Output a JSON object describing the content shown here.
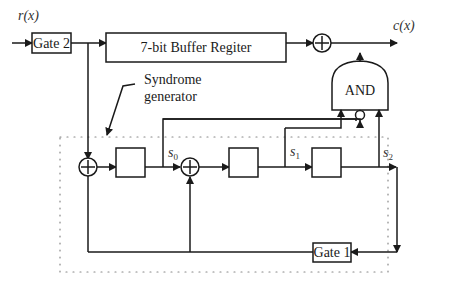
{
  "diagram": {
    "input_label": "r(x)",
    "output_label": "c(x)",
    "gate2_label": "Gate 2",
    "gate1_label": "Gate 1",
    "buffer_label": "7-bit Buffer Regiter",
    "and_label": "AND",
    "syndrome_label_line1": "Syndrome",
    "syndrome_label_line2": "generator",
    "s0_main": "s",
    "s0_sub": "0",
    "s1_main": "s",
    "s1_sub": "1",
    "s2_main": "s",
    "s2_sub": "2",
    "colors": {
      "line": "#1a1a1a",
      "dotted_border": "#888888",
      "background": "#ffffff"
    }
  }
}
